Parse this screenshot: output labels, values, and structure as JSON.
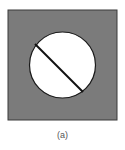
{
  "figure": {
    "caption": "(a)",
    "square": {
      "x": 8,
      "y": 10,
      "width": 109,
      "height": 110,
      "fill": "#7b7b7b",
      "stroke": "#3a3a3a"
    },
    "circle": {
      "cx": 62.5,
      "cy": 65,
      "r": 33,
      "fill": "#ffffff",
      "stroke": "#1a1a1a"
    },
    "slash_line": {
      "x1": 35,
      "y1": 44,
      "x2": 83,
      "y2": 92,
      "stroke": "#111111"
    }
  }
}
